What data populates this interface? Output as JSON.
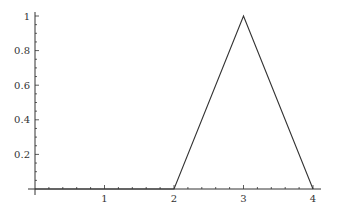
{
  "chart_data": {
    "type": "line",
    "title": "",
    "xlabel": "",
    "ylabel": "",
    "xlim": [
      0,
      4.05
    ],
    "ylim": [
      0,
      1.0
    ],
    "grid": false,
    "legend": null,
    "x_ticks": [
      1,
      2,
      3,
      4
    ],
    "x_tick_labels": [
      "1",
      "2",
      "3",
      "4"
    ],
    "y_ticks": [
      0.2,
      0.4,
      0.6,
      0.8,
      1
    ],
    "y_tick_labels": [
      "0.2",
      "0.4",
      "0.6",
      "0.8",
      "1"
    ],
    "series": [
      {
        "name": "triangular function",
        "x": [
          0,
          2,
          3,
          4
        ],
        "y": [
          0,
          0,
          1,
          0
        ],
        "color": "#333333"
      }
    ]
  },
  "style": {
    "axis_color": "#333333",
    "line_color": "#333333"
  }
}
